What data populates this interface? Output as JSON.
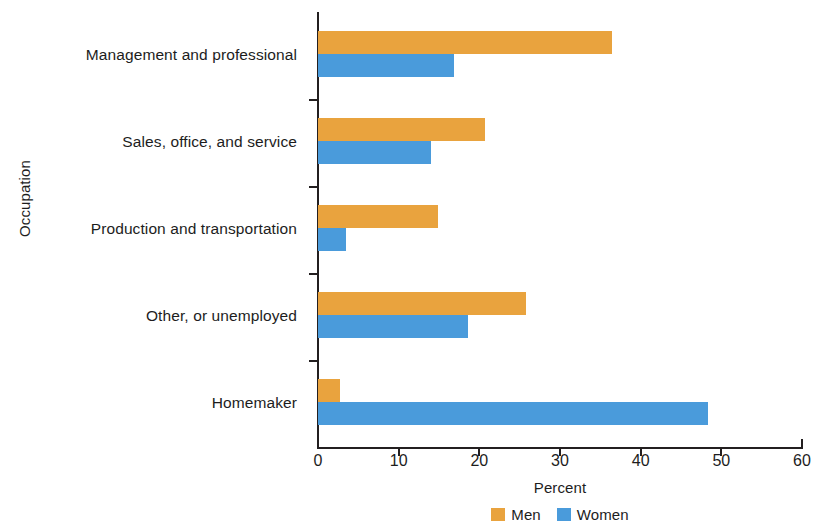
{
  "chart_data": {
    "type": "bar",
    "orientation": "horizontal",
    "title": "",
    "xlabel": "Percent",
    "ylabel": "Occupation",
    "xlim": [
      0,
      60
    ],
    "xticks": [
      0,
      10,
      20,
      30,
      40,
      50,
      60
    ],
    "xtick_labels": [
      "0",
      "10",
      "20",
      "30",
      "40",
      "50",
      "60"
    ],
    "grid": false,
    "legend_position": "bottom-center",
    "categories": [
      "Management and professional",
      "Sales, office, and service",
      "Production and transportation",
      "Other, or unemployed",
      "Homemaker"
    ],
    "series": [
      {
        "name": "Men",
        "color": "#E9A33E",
        "values": [
          36.4,
          20.7,
          14.9,
          25.8,
          2.7
        ]
      },
      {
        "name": "Women",
        "color": "#4A9BDB",
        "values": [
          16.8,
          14.0,
          3.5,
          18.6,
          48.4
        ]
      }
    ]
  },
  "axis": {
    "y_title": "Occupation",
    "x_title": "Percent"
  },
  "legend": {
    "items": [
      {
        "label": "Men",
        "color": "#E9A33E"
      },
      {
        "label": "Women",
        "color": "#4A9BDB"
      }
    ]
  }
}
